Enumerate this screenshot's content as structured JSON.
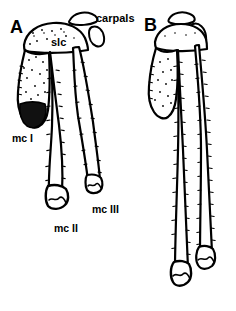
{
  "figure": {
    "type": "anatomical-line-drawing",
    "background_color": "#ffffff",
    "ink_color": "#000000",
    "width_px": 236,
    "height_px": 311
  },
  "panels": [
    {
      "id": "A",
      "letter": "A",
      "letter_pos": {
        "x": 10,
        "y": 18
      },
      "description": "short, robust metacarpus with splayed metacarpals"
    },
    {
      "id": "B",
      "letter": "B",
      "letter_pos": {
        "x": 144,
        "y": 16
      },
      "description": "elongate, slender metacarpus with parallel metacarpals"
    }
  ],
  "labels": [
    {
      "name": "carpals",
      "text": "carpals",
      "x": 96,
      "y": 13,
      "size": "anno",
      "panel": "A"
    },
    {
      "name": "slc",
      "text": "slc",
      "x": 51,
      "y": 37,
      "size": "anno",
      "panel": "A"
    },
    {
      "name": "mc-one",
      "text": "mc I",
      "x": 12,
      "y": 133,
      "size": "anno-small",
      "panel": "A"
    },
    {
      "name": "mc-two",
      "text": "mc II",
      "x": 54,
      "y": 223,
      "size": "anno-small",
      "panel": "A"
    },
    {
      "name": "mc-three",
      "text": "mc III",
      "x": 92,
      "y": 204,
      "size": "anno-small",
      "panel": "A"
    }
  ],
  "colors": {
    "ink": "#000000",
    "background": "#ffffff",
    "fill_dark": "#111111"
  }
}
